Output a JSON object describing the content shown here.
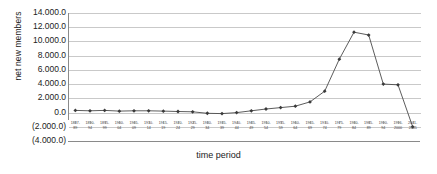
{
  "chart_data": {
    "type": "line",
    "title": "",
    "xlabel": "time period",
    "ylabel": "net new members",
    "ylim": [
      -4000,
      14000
    ],
    "ytick_labels": [
      "14.000.0",
      "12.000.0",
      "10.000.0",
      "8.000.0",
      "6.000.0",
      "4.000.0",
      "2.000.0",
      "0.0",
      "(2.000.0)",
      "(4.000.0)"
    ],
    "ytick_values": [
      14000,
      12000,
      10000,
      8000,
      6000,
      4000,
      2000,
      0,
      -2000,
      -4000
    ],
    "grid": true,
    "legend": "none",
    "marker": "diamond",
    "line_color": "#4a4a4a",
    "grid_color": "#c9c9c9",
    "axis_color": "#8a8a8a",
    "categories": [
      "1887-89",
      "1890-94",
      "1895-99",
      "1900-04",
      "1905-09",
      "1910-14",
      "1915-19",
      "1920-24",
      "1925-29",
      "1930-34",
      "1935-39",
      "1940-44",
      "1945-49",
      "1950-54",
      "1955-59",
      "1960-64",
      "1965-69",
      "1970-74",
      "1975-79",
      "1980-84",
      "1985-89",
      "1990-94",
      "1996-2000",
      "2001-05"
    ],
    "categories_line1": [
      "1887-",
      "1890-",
      "1895-",
      "1900-",
      "1905-",
      "1910-",
      "1915-",
      "1920-",
      "1925-",
      "1930-",
      "1935-",
      "1940-",
      "1945-",
      "1950-",
      "1955-",
      "1960-",
      "1965-",
      "1970-",
      "1975-",
      "1980-",
      "1985-",
      "1990-",
      "1996-",
      "2001-"
    ],
    "categories_line2": [
      "89",
      "94",
      "99",
      "04",
      "09",
      "14",
      "19",
      "24",
      "29",
      "34",
      "39",
      "44",
      "49",
      "54",
      "59",
      "64",
      "69",
      "74",
      "79",
      "84",
      "89",
      "94",
      "2000",
      "2005"
    ],
    "values": [
      300,
      250,
      300,
      200,
      250,
      250,
      200,
      150,
      100,
      -100,
      -150,
      0,
      250,
      500,
      700,
      900,
      1500,
      3000,
      7500,
      11300,
      10900,
      4000,
      3900,
      -2000
    ]
  }
}
